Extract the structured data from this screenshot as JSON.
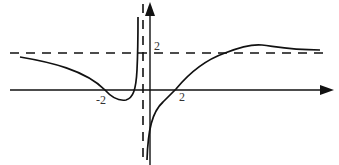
{
  "figure": {
    "type": "function-graph-sketch",
    "colors": {
      "stroke": "#111111",
      "background": "#ffffff",
      "label": "#333333"
    },
    "axes": {
      "x_axis": {
        "arrow": "right"
      },
      "y_axis": {
        "arrow": "up"
      }
    },
    "asymptotes": {
      "horizontal": {
        "y": 2,
        "style": "dashed"
      },
      "vertical": {
        "x": "slightly left of 0",
        "style": "dashed"
      }
    },
    "labels": {
      "x_neg_two": "-2",
      "x_two": "2",
      "y_two": "2"
    },
    "curve_description": "Left branch approaches y=2 from below as x→-∞, crosses x-axis at -2, dips to a local minimum, then rises to +∞ near the vertical asymptote. Right branch comes from -∞ near the vertical asymptote, crosses x-axis at 2, rises above y=2 to a local maximum, then approaches y=2 from above."
  }
}
